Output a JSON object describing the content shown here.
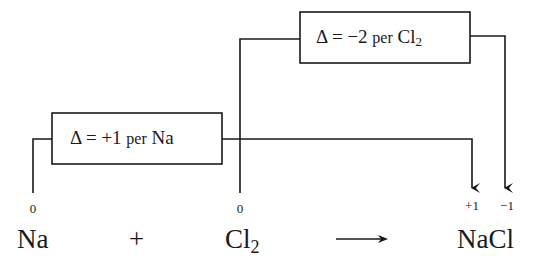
{
  "diagram": {
    "na_change_box": {
      "delta_symbol": "Δ",
      "equals": "=",
      "value": "+1",
      "per": "per",
      "species": "Na"
    },
    "cl_change_box": {
      "delta_symbol": "Δ",
      "equals": "=",
      "value": "−2",
      "per": "per",
      "species": "Cl",
      "subscript": "2"
    },
    "equation": {
      "reactant1": {
        "formula": "Na",
        "oxidation_number": "0"
      },
      "plus": "+",
      "reactant2": {
        "formula": "Cl",
        "subscript": "2",
        "oxidation_number": "0"
      },
      "arrow": "⟶",
      "product": {
        "formula": "NaCl",
        "oxidation_numbers": [
          "+1",
          "−1"
        ]
      }
    },
    "colors": {
      "line": "#1a1a1a",
      "background": "#ffffff"
    }
  }
}
